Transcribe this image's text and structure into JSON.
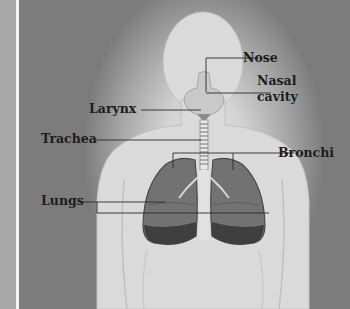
{
  "diagram": {
    "colors": {
      "background_dark": "#7c7c7c",
      "glow_light": "#e6e6e6",
      "left_strip": "#a9a9a9",
      "divider": "#f4f4f4",
      "label_text": "#1c1c1c",
      "leader_line": "#2a2a2a",
      "lung_fill": "#6a6a6a",
      "lung_lower": "#3e3e3e"
    },
    "labels": {
      "nose": "Nose",
      "nasal_cavity_line1": "Nasal",
      "nasal_cavity_line2": "cavity",
      "larynx": "Larynx",
      "trachea": "Trachea",
      "bronchi": "Bronchi",
      "lungs": "Lungs"
    }
  }
}
